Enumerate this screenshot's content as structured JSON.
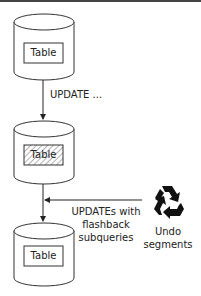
{
  "diagram": {
    "top_table": {
      "label": "Table"
    },
    "middle_table": {
      "label": "Table",
      "hatched": true
    },
    "bottom_table": {
      "label": "Table"
    },
    "update_arrow": {
      "label": "UPDATE ..."
    },
    "flashback_arrow": {
      "line1": "UPDATEs with",
      "line2": "flashback",
      "line3": "subqueries"
    },
    "undo": {
      "icon": "recycle-icon",
      "line1": "Undo",
      "line2": "segments"
    }
  },
  "colors": {
    "stroke": "#333333",
    "hatch": "#555555",
    "icon": "#111111",
    "background": "#ffffff"
  }
}
